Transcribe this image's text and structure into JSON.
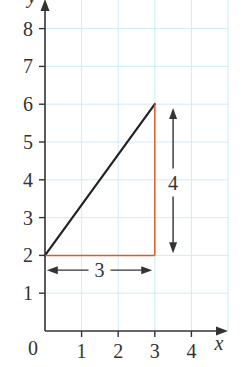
{
  "chart_data": {
    "type": "line",
    "title": "",
    "xlabel": "x",
    "ylabel": "y",
    "xlim": [
      0,
      5
    ],
    "ylim": [
      0,
      8.75
    ],
    "grid": true,
    "origin_label": "0",
    "x_ticks": [
      1,
      2,
      3,
      4
    ],
    "x_tick_labels": [
      "1",
      "2",
      "3",
      "4"
    ],
    "y_ticks": [
      1,
      2,
      3,
      4,
      5,
      6,
      7,
      8
    ],
    "y_tick_labels": [
      "1",
      "2",
      "3",
      "4",
      "5",
      "6",
      "7",
      "8"
    ],
    "series": [
      {
        "name": "line",
        "points": [
          [
            0,
            2
          ],
          [
            3,
            6
          ]
        ],
        "color": "#222222"
      }
    ],
    "annotations": [
      {
        "type": "segment",
        "name": "run-segment",
        "from": [
          0,
          2
        ],
        "to": [
          3,
          2
        ],
        "color": "#e2582c"
      },
      {
        "type": "segment",
        "name": "rise-segment",
        "from": [
          3,
          2
        ],
        "to": [
          3,
          6
        ],
        "color": "#e2582c"
      },
      {
        "type": "double-arrow",
        "name": "run-arrow",
        "orientation": "horizontal",
        "from": [
          0.05,
          1.61
        ],
        "to": [
          2.93,
          1.61
        ],
        "label": "3"
      },
      {
        "type": "double-arrow",
        "name": "rise-arrow",
        "orientation": "vertical",
        "from": [
          3.5,
          2.06
        ],
        "to": [
          3.5,
          5.9
        ],
        "label": "4"
      }
    ]
  },
  "colors": {
    "grid": "#c9eef5",
    "axis": "#333333",
    "text": "#333333"
  }
}
